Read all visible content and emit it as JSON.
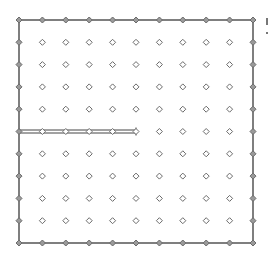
{
  "diagram": {
    "type": "dot-grid-board",
    "grid": {
      "columns": 11,
      "rows": 11,
      "origin_x": 19,
      "origin_y": 20,
      "spacing_x": 23.4,
      "spacing_y": 22.3,
      "dot_shape": "hollow-diamond",
      "dot_color": "#6b6b6b"
    },
    "border": {
      "drawn": true,
      "color": "#555555",
      "width": 1.5
    },
    "drawn_segments": [
      {
        "id": "partial-double-line",
        "row": 5,
        "from_col": 0,
        "to_col": 5,
        "style": "double",
        "color": "#444444",
        "end_marker": "cross-tick"
      }
    ],
    "edge_fragments": [
      {
        "x": 266,
        "y": 18,
        "w": 2,
        "h": 7
      },
      {
        "x": 266,
        "y": 32,
        "w": 2,
        "h": 2
      }
    ]
  }
}
